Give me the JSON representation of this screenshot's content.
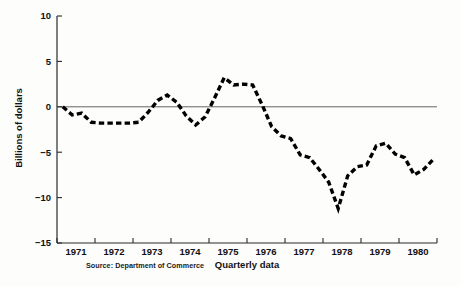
{
  "chart_data": {
    "type": "line",
    "title": "",
    "subtitle": "",
    "xlabel": "Quarterly data",
    "ylabel": "Billions of dollars",
    "ylim": [
      -15,
      10
    ],
    "xlim": [
      1970.75,
      1980.75
    ],
    "grid": false,
    "legend": null,
    "line_style": "dashed",
    "line_color": "#000000",
    "zero_reference_line": true,
    "y_ticks": [
      10,
      5,
      0,
      -5,
      -10,
      -15
    ],
    "y_tick_labels": [
      "10",
      "5",
      "0",
      "-5",
      "-10",
      "-15"
    ],
    "x_ticks": [
      1970.75,
      1971.75,
      1972.75,
      1973.75,
      1974.75,
      1975.75,
      1976.75,
      1977.75,
      1978.75,
      1979.75,
      1980.75
    ],
    "x_tick_labels": [
      "1971",
      "1972",
      "1973",
      "1974",
      "1975",
      "1976",
      "1977",
      "1978",
      "1979",
      "1980"
    ],
    "x_label_positions": [
      1971.25,
      1972.25,
      1973.25,
      1974.25,
      1975.25,
      1976.25,
      1977.25,
      1978.25,
      1979.25,
      1980.25
    ],
    "source": "Source: Department of Commerce",
    "x": [
      1970.9,
      1971.15,
      1971.4,
      1971.65,
      1971.9,
      1972.15,
      1972.4,
      1972.65,
      1972.9,
      1973.15,
      1973.4,
      1973.65,
      1973.9,
      1974.15,
      1974.4,
      1974.65,
      1974.9,
      1975.15,
      1975.4,
      1975.65,
      1975.9,
      1976.15,
      1976.4,
      1976.65,
      1976.9,
      1977.15,
      1977.4,
      1977.65,
      1977.9,
      1978.15,
      1978.4,
      1978.65,
      1978.9,
      1979.15,
      1979.4,
      1979.65,
      1979.9,
      1980.15,
      1980.4,
      1980.65
    ],
    "values": [
      0.0,
      -0.9,
      -0.7,
      -1.7,
      -1.8,
      -1.8,
      -1.8,
      -1.8,
      -1.7,
      -0.6,
      0.7,
      1.3,
      0.5,
      -1.0,
      -2.0,
      -1.1,
      1.0,
      3.2,
      2.4,
      2.5,
      2.4,
      0.2,
      -2.2,
      -3.2,
      -3.5,
      -5.3,
      -5.6,
      -6.9,
      -8.3,
      -11.2,
      -7.6,
      -6.6,
      -6.4,
      -4.3,
      -4.0,
      -5.2,
      -5.6,
      -7.5,
      -6.9,
      -5.8
    ]
  },
  "labels": {
    "y_axis_title": "Billions of dollars",
    "x_axis_title": "Quarterly data",
    "source_note": "Source: Department of Commerce"
  },
  "geometry": {
    "plot_left": 57,
    "plot_right": 437,
    "plot_top": 16,
    "plot_bottom": 243,
    "y_zero_px": 107
  }
}
